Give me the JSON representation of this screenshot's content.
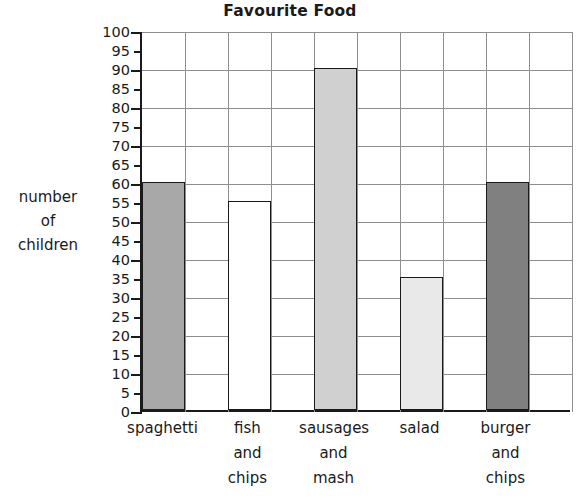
{
  "chart_data": {
    "type": "bar",
    "title": "Favourite Food",
    "xlabel": "",
    "ylabel": "number of children",
    "ylabel_lines": [
      "number",
      "of",
      "children"
    ],
    "categories": [
      "spaghetti",
      "fish and chips",
      "sausages and mash",
      "salad",
      "burger and chips"
    ],
    "category_lines": [
      [
        "spaghetti"
      ],
      [
        "fish",
        "and",
        "chips"
      ],
      [
        "sausages",
        "and",
        "mash"
      ],
      [
        "salad"
      ],
      [
        "burger",
        "and",
        "chips"
      ]
    ],
    "values": [
      60,
      55,
      90,
      35,
      60
    ],
    "bar_colors": [
      "#a8a8a8",
      "#ffffff",
      "#d0d0d0",
      "#e9e9e9",
      "#808080"
    ],
    "ylim": [
      0,
      100
    ],
    "ytick_step": 5,
    "ytick_labels": [
      "100",
      "95",
      "90",
      "85",
      "80",
      "75",
      "70",
      "65",
      "60",
      "55",
      "50",
      "45",
      "40",
      "35",
      "30",
      "25",
      "20",
      "15",
      "10",
      "5",
      "0"
    ],
    "grid": true,
    "grid_major_step": 10,
    "legend": "none"
  },
  "axis": {
    "axis_color": "#1a1a1a",
    "grid_color": "#8e8e8e"
  }
}
